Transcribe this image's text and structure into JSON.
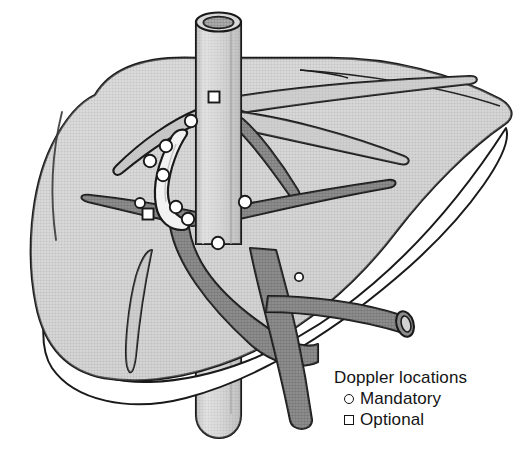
{
  "figure": {
    "style": "grayscale-halftone-line-illustration",
    "colors": {
      "outline": "#1a1a1a",
      "liver_fill": "#c9c9c9",
      "liver_fill_light": "#d6d6d6",
      "liver_edge_white": "#ffffff",
      "vein_dark": "#7f7f7f",
      "vein_light": "#c2c2c2",
      "duct_pale": "#f0f0f0",
      "ivc_fill": "#cfcfcf",
      "lumen_dark": "#9a9a9a",
      "marker_fill": "#ffffff",
      "background": "#ffffff"
    },
    "structures": [
      {
        "name": "inferior-vena-cava",
        "kind": "vertical-cut-tube",
        "shade": "light"
      },
      {
        "name": "liver-parenchyma",
        "kind": "organ-silhouette",
        "shade": "medium"
      },
      {
        "name": "liver-inferior-white-border",
        "kind": "edge-highlight",
        "shade": "white"
      },
      {
        "name": "hepatic-veins",
        "kind": "branching-vessels",
        "shade": "light"
      },
      {
        "name": "portal-vein",
        "kind": "branching-vessels",
        "shade": "dark"
      },
      {
        "name": "bile-duct",
        "kind": "curved-vessel",
        "shade": "pale"
      }
    ]
  },
  "legend": {
    "title": "Doppler locations",
    "items": [
      {
        "marker": "circle-outline-icon",
        "label": "Mandatory"
      },
      {
        "marker": "square-outline-icon",
        "label": "Optional"
      }
    ]
  },
  "markers": {
    "mandatory_count": 10,
    "optional_count": 2,
    "mandatory": [
      {
        "id": "m1",
        "x": 191,
        "y": 121,
        "r": 6.2,
        "on": "hepatic-vein-confluence"
      },
      {
        "id": "m2",
        "x": 166,
        "y": 146,
        "r": 6.2,
        "on": "bile-duct-upper"
      },
      {
        "id": "m3",
        "x": 150,
        "y": 161,
        "r": 6.2,
        "on": "portal-branch-left-upper"
      },
      {
        "id": "m4",
        "x": 163,
        "y": 175,
        "r": 6.2,
        "on": "bile-duct-mid"
      },
      {
        "id": "m5",
        "x": 176,
        "y": 207,
        "r": 6.2,
        "on": "bile-duct-lower"
      },
      {
        "id": "m6",
        "x": 188,
        "y": 219,
        "r": 6.2,
        "on": "portal-vein-main"
      },
      {
        "id": "m7",
        "x": 140,
        "y": 203,
        "r": 5.0,
        "on": "portal-branch-left"
      },
      {
        "id": "m8",
        "x": 245,
        "y": 202,
        "r": 6.2,
        "on": "portal-branch-right"
      },
      {
        "id": "m9",
        "x": 218,
        "y": 243,
        "r": 6.2,
        "on": "portal-vein-descending"
      },
      {
        "id": "m10",
        "x": 299,
        "y": 277,
        "r": 4.2,
        "on": "portal-branch-right-distal"
      }
    ],
    "optional": [
      {
        "id": "o1",
        "x": 214,
        "y": 97,
        "s": 11,
        "on": "inferior-vena-cava"
      },
      {
        "id": "o2",
        "x": 148,
        "y": 214,
        "s": 11,
        "on": "portal-branch-left-tip"
      }
    ]
  }
}
